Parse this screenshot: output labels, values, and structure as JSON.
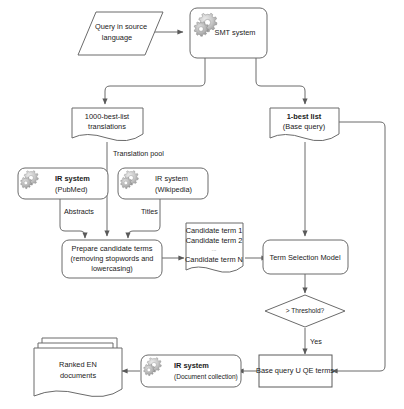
{
  "diagram": {
    "nodes": {
      "query_source": {
        "label_line1": "Query in source",
        "label_line2": "language",
        "shape": "parallelogram"
      },
      "smt_system": {
        "label": "SMT system",
        "shape": "rounded-rect",
        "icon": "gears-icon"
      },
      "thousand_best": {
        "label_line1": "1000-best-list",
        "label_line2": "translations",
        "shape": "document"
      },
      "one_best": {
        "label_line1": "1-best list",
        "label_line2": "(Base query)",
        "shape": "document"
      },
      "ir_pubmed": {
        "label_line1": "IR system",
        "label_line2": "(PubMed)",
        "shape": "rounded-rect",
        "icon": "gears-icon"
      },
      "ir_wikipedia": {
        "label_line1": "IR system",
        "label_line2": "(Wikipedia)",
        "shape": "rounded-rect",
        "icon": "gears-icon"
      },
      "prepare_terms": {
        "label_line1": "Prepare candidate terms",
        "label_line2": "(removing stopwords and",
        "label_line3": "lowercasing)",
        "shape": "rounded-rect"
      },
      "candidate_terms": {
        "label_line1": "Candidate term 1",
        "label_line2": "Candidate term 2",
        "label_ellipsis": "...",
        "label_line3": "Candidate term N",
        "shape": "document"
      },
      "term_selection": {
        "label": "Term Selection Model",
        "shape": "rounded-rect"
      },
      "threshold": {
        "label": "> Threshold?",
        "shape": "diamond"
      },
      "base_query_union": {
        "label": "Base query  U  QE terms",
        "shape": "rect"
      },
      "ir_documents": {
        "label_line1": "IR system",
        "label_line2": "(Document collection)",
        "shape": "rounded-rect",
        "icon": "gears-icon"
      },
      "ranked_documents": {
        "label_line1": "Ranked EN",
        "label_line2": "documents",
        "shape": "multi-document"
      }
    },
    "edge_labels": {
      "translation_pool": "Translation pool",
      "abstracts": "Abstracts",
      "titles": "Titles",
      "yes": "Yes"
    },
    "colors": {
      "stroke": "#6b6b6b",
      "text": "#1a1a1a",
      "background": "#ffffff",
      "gear_light": "#d8d8d8",
      "gear_dark": "#9a9a9a"
    }
  }
}
